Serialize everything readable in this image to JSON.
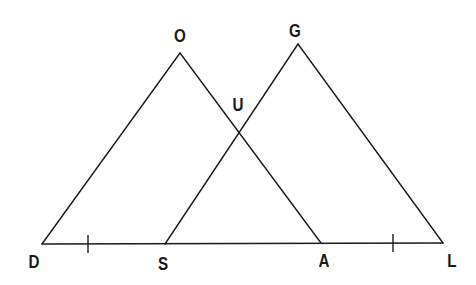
{
  "diagram": {
    "type": "geometry",
    "points": {
      "D": {
        "label": "D",
        "x": 42,
        "y": 244
      },
      "S": {
        "label": "S",
        "x": 165,
        "y": 244
      },
      "A": {
        "label": "A",
        "x": 321,
        "y": 243
      },
      "L": {
        "label": "L",
        "x": 443,
        "y": 243
      },
      "O": {
        "label": "O",
        "x": 180,
        "y": 53
      },
      "G": {
        "label": "G",
        "x": 298,
        "y": 44
      },
      "U": {
        "label": "U",
        "x": 238,
        "y": 133
      }
    },
    "labels": {
      "D": {
        "text": "D",
        "x": 34,
        "y": 268
      },
      "S": {
        "text": "S",
        "x": 163,
        "y": 270
      },
      "A": {
        "text": "A",
        "x": 324,
        "y": 267
      },
      "L": {
        "text": "L",
        "x": 452,
        "y": 267
      },
      "O": {
        "text": "O",
        "x": 180,
        "y": 42
      },
      "G": {
        "text": "G",
        "x": 295,
        "y": 37
      },
      "U": {
        "text": "U",
        "x": 238,
        "y": 111
      }
    },
    "segments": [
      [
        "D",
        "L"
      ],
      [
        "D",
        "O"
      ],
      [
        "O",
        "A"
      ],
      [
        "S",
        "G"
      ],
      [
        "G",
        "L"
      ]
    ],
    "tick_marks": [
      {
        "segment": [
          "D",
          "S"
        ],
        "x": 88
      },
      {
        "segment": [
          "A",
          "L"
        ],
        "x": 393
      }
    ],
    "colors": {
      "stroke": "#1a1a1a",
      "background": "#ffffff"
    }
  }
}
